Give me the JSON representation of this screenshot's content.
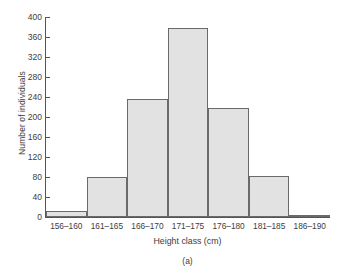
{
  "chart_data": {
    "type": "bar",
    "title": "",
    "xlabel": "Height class (cm)",
    "ylabel": "Number of individuals",
    "caption": "(a)",
    "categories": [
      "156–160",
      "161–165",
      "166–170",
      "171–175",
      "176–180",
      "181–185",
      "186–190"
    ],
    "values": [
      12,
      80,
      237,
      379,
      218,
      82,
      4
    ],
    "ylim": [
      0,
      400
    ],
    "yticks": [
      0,
      40,
      80,
      120,
      160,
      200,
      240,
      280,
      320,
      360,
      400
    ],
    "ytick_labels": [
      "0",
      "40",
      "80",
      "120",
      "160",
      "200",
      "240",
      "280",
      "320",
      "360",
      "400"
    ],
    "grid": false,
    "legend": false,
    "bar_fill_color": "#e2e2e2",
    "bar_edge_color": "#6a6a6a",
    "axis_color": "#555555",
    "text_color": "#3d3d3d"
  }
}
